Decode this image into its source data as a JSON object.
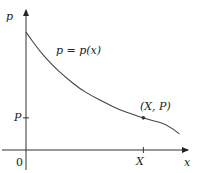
{
  "chart_data": {
    "type": "line",
    "title": "",
    "xlabel": "x",
    "ylabel": "p",
    "curve_label": "p = p(x)",
    "origin_label": "0",
    "x_tick_label": "X",
    "y_tick_label": "P",
    "point_label": "(X, P)",
    "xlim": [
      0,
      1.2
    ],
    "ylim": [
      0,
      1
    ],
    "point": {
      "x": 0.88,
      "y": 0.24
    },
    "series": [
      {
        "name": "p = p(x)",
        "x": [
          0,
          0.1,
          0.2,
          0.3,
          0.4,
          0.5,
          0.6,
          0.7,
          0.8,
          0.88,
          0.95,
          1.05,
          1.15
        ],
        "y": [
          0.88,
          0.74,
          0.63,
          0.54,
          0.46,
          0.4,
          0.35,
          0.3,
          0.265,
          0.24,
          0.22,
          0.195,
          0.12
        ]
      }
    ],
    "grid": false,
    "legend": "none"
  }
}
